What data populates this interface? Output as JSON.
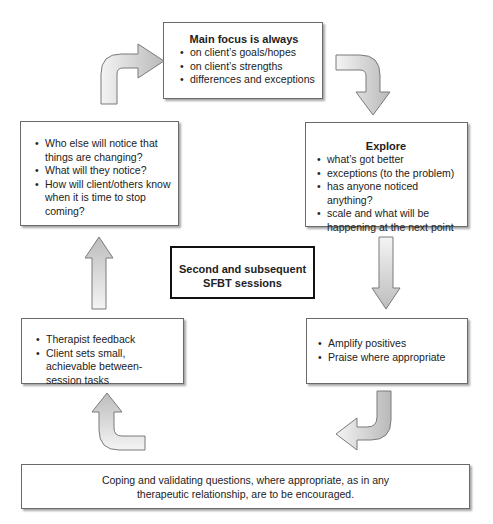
{
  "diagram": {
    "center": {
      "line1": "Second and subsequent",
      "line2": "SFBT sessions"
    },
    "top_box": {
      "title": "Main focus is always",
      "items": [
        "on client’s goals/hopes",
        "on client’s strengths",
        "differences and exceptions"
      ]
    },
    "explore_box": {
      "title": "Explore",
      "items": [
        "what’s got better",
        "exceptions (to the problem)",
        "has anyone noticed anything?",
        "scale and what will be happening at the next point"
      ]
    },
    "amplify_box": {
      "items": [
        "Amplify positives",
        "Praise where appropriate"
      ]
    },
    "feedback_box": {
      "items": [
        "Therapist feedback",
        "Client sets small, achievable between-session tasks"
      ]
    },
    "notice_box": {
      "items": [
        "Who else will notice that things are changing?",
        "What will they notice?",
        "How will client/others know when it is time to stop coming?"
      ]
    },
    "bottom_box": {
      "line1": "Coping and validating questions, where appropriate, as in any",
      "line2": "therapeutic relationship, are to be encouraged."
    },
    "arrows": [
      {
        "name": "curved-arrow-top-left",
        "direction": "up-then-right"
      },
      {
        "name": "curved-arrow-top-right",
        "direction": "right-then-down"
      },
      {
        "name": "straight-arrow-right",
        "direction": "down"
      },
      {
        "name": "curved-arrow-bottom-right",
        "direction": "down-then-left"
      },
      {
        "name": "curved-arrow-bottom-left",
        "direction": "left-then-up"
      },
      {
        "name": "straight-arrow-left",
        "direction": "up"
      }
    ],
    "colors": {
      "arrow_fill_light": "#f2f2f2",
      "arrow_fill_dark": "#b8b8b8",
      "arrow_stroke": "#7a7a7a",
      "box_border": "#6a6a6a",
      "center_border": "#111111"
    }
  }
}
